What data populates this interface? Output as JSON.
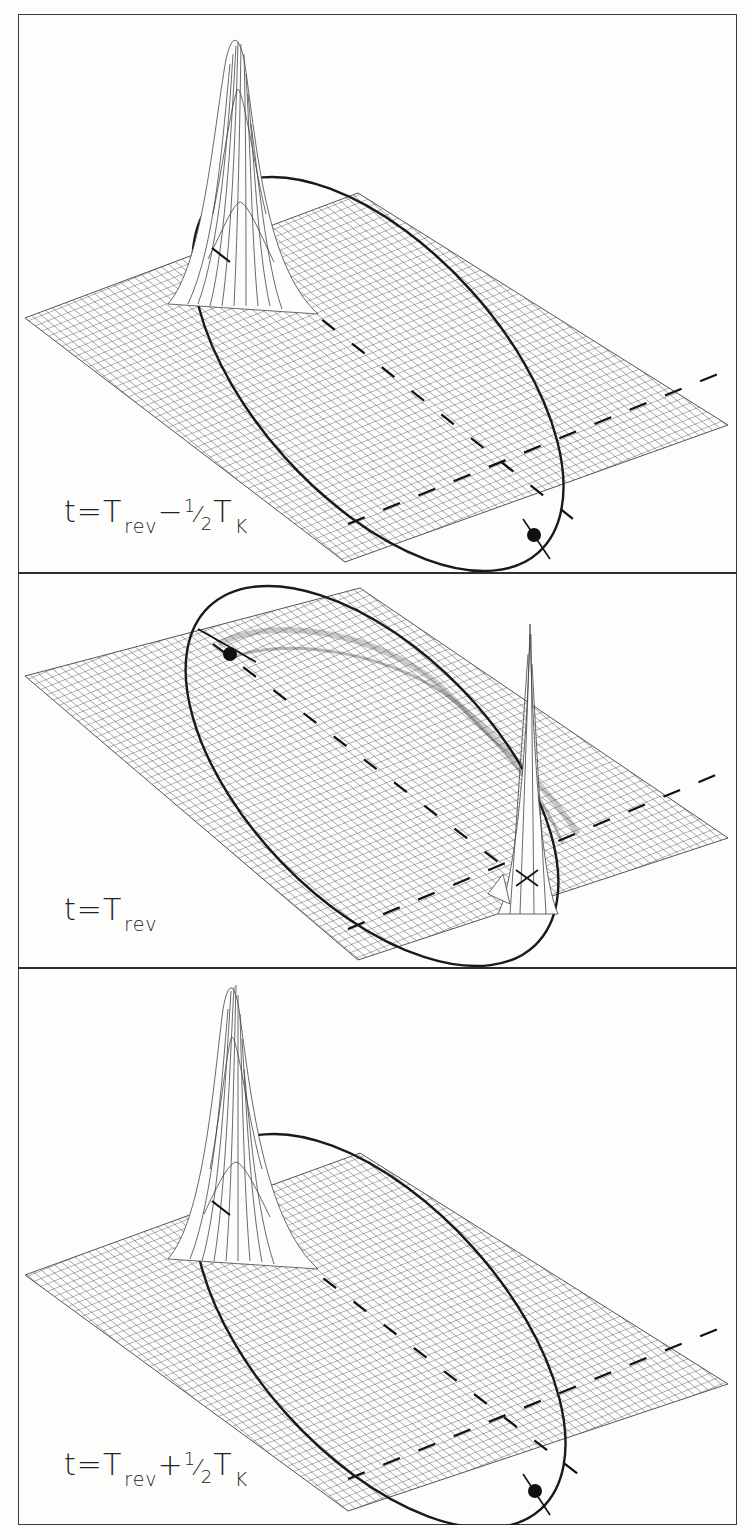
{
  "figure": {
    "panel_count": 3,
    "colors": {
      "grid": "#555555",
      "orbit": "#1a1a1a",
      "frame": "#333333",
      "background": "#fdfdfb",
      "bleed_text": "#e4e4e0"
    },
    "panels": [
      {
        "id": "panel-1",
        "label": {
          "t": "t",
          "eq": "=",
          "T": "T",
          "rev": "rev",
          "op": "−",
          "num": "1",
          "slash": "⁄",
          "den": "2",
          "T2": "T",
          "K": "K"
        },
        "label_text": "t = T_rev − ½ T_K",
        "peak_position": "apoapsis (upper-left)",
        "marker_position": "periapsis (lower-right)"
      },
      {
        "id": "panel-2",
        "label": {
          "t": "t",
          "eq": "=",
          "T": "T",
          "rev": "rev"
        },
        "label_text": "t = T_rev",
        "peak_position": "periapsis (lower-right)",
        "marker_position": "apoapsis (upper-left)"
      },
      {
        "id": "panel-3",
        "label": {
          "t": "t",
          "eq": "=",
          "T": "T",
          "rev": "rev",
          "op": "+",
          "num": "1",
          "slash": "⁄",
          "den": "2",
          "T2": "T",
          "K": "K"
        },
        "label_text": "t = T_rev + ½ T_K",
        "peak_position": "apoapsis (upper-left)",
        "marker_position": "periapsis (lower-right)"
      }
    ]
  }
}
